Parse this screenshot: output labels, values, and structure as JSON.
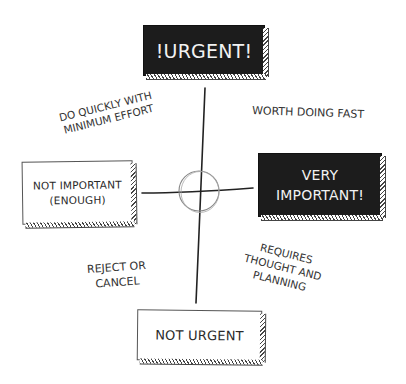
{
  "diagram": {
    "type": "priority-matrix",
    "colors": {
      "ink": "#222222",
      "dark_box": "#1c1c1c",
      "dark_text": "#f2f2f2",
      "light_box": "#ffffff",
      "circle": "#888888"
    },
    "axes": {
      "top": {
        "label": "!URGENT!",
        "style": "dark"
      },
      "right": {
        "label_line1": "VERY",
        "label_line2": "IMPORTANT!",
        "style": "dark"
      },
      "left": {
        "label_line1": "NOT IMPORTANT",
        "label_line2": "(ENOUGH)",
        "style": "light"
      },
      "bottom": {
        "label": "NOT URGENT",
        "style": "light"
      }
    },
    "quadrants": {
      "top_left": {
        "line1": "DO QUICKLY WITH",
        "line2": "MINIMUM EFFORT"
      },
      "top_right": {
        "line1": "WORTH DOING FAST"
      },
      "bottom_left": {
        "line1": "REJECT OR",
        "line2": "CANCEL"
      },
      "bottom_right": {
        "line1": "REQUIRES",
        "line2": "THOUGHT AND",
        "line3": "PLANNING"
      }
    }
  }
}
